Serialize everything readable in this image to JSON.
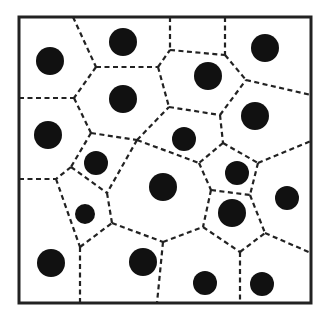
{
  "diagram": {
    "type": "voronoi-tessellation",
    "colors": {
      "frame": "#222222",
      "edge": "#222222",
      "site": "#111111",
      "background": "#ffffff"
    },
    "frame": {
      "x": 19,
      "y": 17,
      "width": 292,
      "height": 286
    },
    "sites": [
      {
        "cx": 50,
        "cy": 61,
        "r": 14
      },
      {
        "cx": 123,
        "cy": 42,
        "r": 14
      },
      {
        "cx": 265,
        "cy": 48,
        "r": 14
      },
      {
        "cx": 123,
        "cy": 99,
        "r": 14
      },
      {
        "cx": 208,
        "cy": 76,
        "r": 14
      },
      {
        "cx": 48,
        "cy": 135,
        "r": 14
      },
      {
        "cx": 184,
        "cy": 139,
        "r": 12
      },
      {
        "cx": 255,
        "cy": 116,
        "r": 14
      },
      {
        "cx": 96,
        "cy": 163,
        "r": 12
      },
      {
        "cx": 163,
        "cy": 187,
        "r": 14
      },
      {
        "cx": 237,
        "cy": 173,
        "r": 12
      },
      {
        "cx": 287,
        "cy": 198,
        "r": 12
      },
      {
        "cx": 232,
        "cy": 213,
        "r": 14
      },
      {
        "cx": 85,
        "cy": 214,
        "r": 10
      },
      {
        "cx": 51,
        "cy": 263,
        "r": 14
      },
      {
        "cx": 143,
        "cy": 262,
        "r": 14
      },
      {
        "cx": 205,
        "cy": 283,
        "r": 12
      },
      {
        "cx": 262,
        "cy": 284,
        "r": 12
      }
    ],
    "edges": [
      [
        73,
        17,
        96,
        67
      ],
      [
        96,
        67,
        74,
        98
      ],
      [
        19,
        98,
        74,
        98
      ],
      [
        96,
        67,
        158,
        67
      ],
      [
        170,
        17,
        170,
        50
      ],
      [
        170,
        50,
        225,
        55
      ],
      [
        225,
        17,
        225,
        55
      ],
      [
        158,
        67,
        170,
        50
      ],
      [
        225,
        55,
        246,
        80
      ],
      [
        246,
        80,
        311,
        95
      ],
      [
        158,
        67,
        169,
        107
      ],
      [
        169,
        107,
        220,
        115
      ],
      [
        220,
        115,
        246,
        80
      ],
      [
        74,
        98,
        91,
        133
      ],
      [
        91,
        133,
        137,
        140
      ],
      [
        137,
        140,
        169,
        107
      ],
      [
        91,
        133,
        71,
        167
      ],
      [
        71,
        167,
        56,
        179
      ],
      [
        19,
        179,
        56,
        179
      ],
      [
        71,
        167,
        107,
        193
      ],
      [
        107,
        193,
        112,
        223
      ],
      [
        56,
        179,
        80,
        247
      ],
      [
        80,
        247,
        112,
        223
      ],
      [
        80,
        247,
        80,
        303
      ],
      [
        137,
        140,
        107,
        193
      ],
      [
        137,
        140,
        199,
        163
      ],
      [
        220,
        115,
        223,
        143
      ],
      [
        223,
        143,
        199,
        163
      ],
      [
        223,
        143,
        258,
        163
      ],
      [
        258,
        163,
        311,
        141
      ],
      [
        199,
        163,
        211,
        190
      ],
      [
        211,
        190,
        250,
        195
      ],
      [
        258,
        163,
        250,
        195
      ],
      [
        112,
        223,
        163,
        242
      ],
      [
        163,
        242,
        157,
        303
      ],
      [
        163,
        242,
        203,
        227
      ],
      [
        211,
        190,
        203,
        227
      ],
      [
        203,
        227,
        240,
        252
      ],
      [
        240,
        252,
        240,
        303
      ],
      [
        240,
        252,
        265,
        233
      ],
      [
        250,
        195,
        265,
        233
      ],
      [
        265,
        233,
        311,
        253
      ]
    ]
  }
}
